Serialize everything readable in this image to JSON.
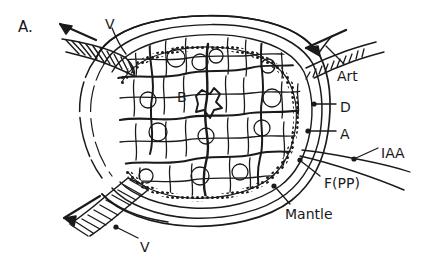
{
  "figure": {
    "panel_label": "A.",
    "caption_type": "anatomical cross-section",
    "background_color": "#ffffff",
    "ink_color": "#1a1a1a"
  },
  "labels": {
    "panel": "A.",
    "vein_top": "V",
    "vein_bottom": "V",
    "artery": "Art",
    "d_layer": "D",
    "a_layer": "A",
    "iaa": "IAA",
    "f_pp": "F(PP)",
    "mantle": "Mantle",
    "interior_b": "B"
  },
  "structures": [
    {
      "key": "vein_top",
      "label": "V",
      "type": "vessel",
      "note": "striated vessel exiting upper-left with outflow arrow"
    },
    {
      "key": "vein_bottom",
      "label": "V",
      "type": "vessel",
      "note": "striated vessel exiting lower-left with outflow arrow"
    },
    {
      "key": "artery",
      "label": "Art",
      "type": "vessel",
      "note": "hatched vessel entering upper-right with inflow arrow"
    },
    {
      "key": "d_layer",
      "label": "D",
      "type": "layer",
      "note": "outer boundary layer on right margin"
    },
    {
      "key": "a_layer",
      "label": "A",
      "type": "layer",
      "note": "inner boundary layer on right margin"
    },
    {
      "key": "iaa",
      "label": "IAA",
      "type": "vessel",
      "note": "vessel running off to lower right"
    },
    {
      "key": "f_pp",
      "label": "F(PP)",
      "type": "region",
      "note": "peripheral region at lower right of capsule"
    },
    {
      "key": "mantle",
      "label": "Mantle",
      "type": "region",
      "note": "outermost enveloping layer"
    },
    {
      "key": "interior_b",
      "label": "B",
      "type": "parenchyma",
      "note": "lobulated polygonal cell mass filling the core"
    }
  ],
  "arrows": [
    {
      "key": "outflow-top",
      "direction": "up-left",
      "meaning": "venous outflow"
    },
    {
      "key": "outflow-bottom",
      "direction": "down-left",
      "meaning": "venous outflow"
    },
    {
      "key": "inflow-right",
      "direction": "down-left",
      "meaning": "arterial inflow"
    }
  ],
  "label_positions": {
    "panel": {
      "x": 18,
      "y": 20
    },
    "vein_top": {
      "x": 105,
      "y": 17
    },
    "artery": {
      "x": 337,
      "y": 69
    },
    "d_layer": {
      "x": 340,
      "y": 100
    },
    "a_layer": {
      "x": 340,
      "y": 127
    },
    "iaa": {
      "x": 381,
      "y": 146
    },
    "f_pp": {
      "x": 324,
      "y": 176
    },
    "mantle": {
      "x": 285,
      "y": 207
    },
    "vein_bottom": {
      "x": 140,
      "y": 240
    },
    "interior_b": {
      "x": 177,
      "y": 90
    }
  }
}
